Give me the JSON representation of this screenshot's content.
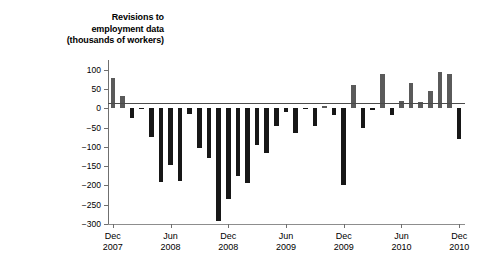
{
  "chart_data": {
    "type": "bar",
    "title": "Revisions to employment data (thousands of workers)",
    "title_lines": [
      "Revisions to",
      "employment data",
      "(thousands of workers)"
    ],
    "xlabel": "",
    "ylabel": "thousands of workers",
    "ylim": [
      -300,
      125
    ],
    "yticks": [
      100,
      50,
      0,
      -50,
      -100,
      -150,
      -200,
      -250,
      -300
    ],
    "ytick_labels": [
      "100",
      "50",
      "0",
      "−50",
      "−100",
      "−150",
      "−200",
      "−250",
      "−300"
    ],
    "grid": false,
    "legend": null,
    "xtick_labels": [
      {
        "month": "Dec",
        "year": "2007"
      },
      {
        "month": "Jun",
        "year": "2008"
      },
      {
        "month": "Dec",
        "year": "2008"
      },
      {
        "month": "Jun",
        "year": "2009"
      },
      {
        "month": "Dec",
        "year": "2009"
      },
      {
        "month": "Jun",
        "year": "2010"
      },
      {
        "month": "Dec",
        "year": "2010"
      }
    ],
    "xtick_indices": [
      0,
      6,
      12,
      18,
      24,
      30,
      36
    ],
    "categories": [
      "Dec 2007",
      "Jan 2008",
      "Feb 2008",
      "Mar 2008",
      "Apr 2008",
      "May 2008",
      "Jun 2008",
      "Jul 2008",
      "Aug 2008",
      "Sep 2008",
      "Oct 2008",
      "Nov 2008",
      "Dec 2008",
      "Jan 2009",
      "Feb 2009",
      "Mar 2009",
      "Apr 2009",
      "May 2009",
      "Jun 2009",
      "Jul 2009",
      "Aug 2009",
      "Sep 2009",
      "Oct 2009",
      "Nov 2009",
      "Dec 2009",
      "Jan 2010",
      "Feb 2010",
      "Mar 2010",
      "Apr 2010",
      "May 2010",
      "Jun 2010",
      "Jul 2010",
      "Aug 2010",
      "Sep 2010",
      "Oct 2010",
      "Nov 2010",
      "Dec 2010"
    ],
    "values": [
      78,
      33,
      -25,
      -3,
      -75,
      -192,
      -148,
      -188,
      -15,
      -103,
      -128,
      -292,
      -235,
      -175,
      -195,
      -95,
      -115,
      -45,
      -10,
      -65,
      -3,
      -45,
      5,
      -18,
      -200,
      60,
      -50,
      -5,
      90,
      -18,
      20,
      65,
      15,
      45,
      95,
      88,
      -80
    ],
    "colors": {
      "positive_bar": "#5a5a5a",
      "negative_bar": "#171717",
      "axis": "#6f6f6f",
      "text": "#000000"
    }
  }
}
